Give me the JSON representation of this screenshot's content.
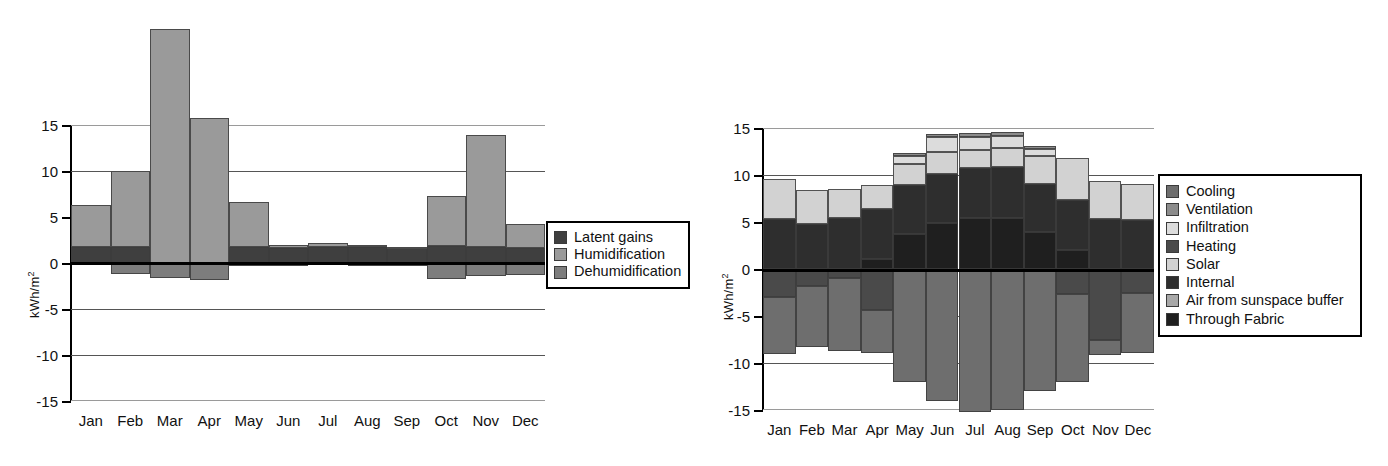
{
  "charts": [
    {
      "id": "latent-loads",
      "ylabel": "kWh/m",
      "ylabel_sup": "2",
      "yticks": [
        "15",
        "10",
        "5",
        "0",
        "-5",
        "-10",
        "-15"
      ],
      "ytick_values": [
        15,
        10,
        5,
        0,
        -5,
        -10,
        -15
      ],
      "categories": [
        "Jan",
        "Feb",
        "Mar",
        "Apr",
        "May",
        "Jun",
        "Jul",
        "Aug",
        "Sep",
        "Oct",
        "Nov",
        "Dec"
      ],
      "legend": [
        {
          "label": "Latent gains",
          "color": "#3f3f3f"
        },
        {
          "label": "Humidification",
          "color": "#9a9a9a"
        },
        {
          "label": "Dehumidification",
          "color": "#7d7d7d"
        }
      ]
    },
    {
      "id": "sensible-loads",
      "ylabel": "kWh/m",
      "ylabel_sup": "2",
      "yticks": [
        "15",
        "10",
        "5",
        "0",
        "-5",
        "-10",
        "-15"
      ],
      "ytick_values": [
        15,
        10,
        5,
        0,
        -5,
        -10,
        -15
      ],
      "categories": [
        "Jan",
        "Feb",
        "Mar",
        "Apr",
        "May",
        "Jun",
        "Jul",
        "Aug",
        "Sep",
        "Oct",
        "Nov",
        "Dec"
      ],
      "legend": [
        {
          "label": "Cooling",
          "color": "#6e6e6e"
        },
        {
          "label": "Ventilation",
          "color": "#8c8c8c"
        },
        {
          "label": "Infiltration",
          "color": "#dcdcdc"
        },
        {
          "label": "Heating",
          "color": "#4a4a4a"
        },
        {
          "label": "Solar",
          "color": "#d2d2d2"
        },
        {
          "label": "Internal",
          "color": "#2e2e2e"
        },
        {
          "label": "Air from sunspace buffer",
          "color": "#a8a8a8"
        },
        {
          "label": "Through Fabric",
          "color": "#1f1f1f"
        }
      ]
    }
  ],
  "chart_data": [
    {
      "type": "bar",
      "stacked": true,
      "title": "",
      "xlabel": "",
      "ylabel": "kWh/m2",
      "ylim": [
        -15,
        15
      ],
      "yticks": [
        -15,
        -10,
        -5,
        0,
        5,
        10,
        15
      ],
      "grid": true,
      "legend_position": "right",
      "categories": [
        "Jan",
        "Feb",
        "Mar",
        "Apr",
        "May",
        "Jun",
        "Jul",
        "Aug",
        "Sep",
        "Oct",
        "Nov",
        "Dec"
      ],
      "series": [
        {
          "name": "Latent gains",
          "color": "#3f3f3f",
          "values": [
            1.7,
            1.7,
            0.0,
            0.0,
            1.7,
            1.6,
            1.7,
            1.7,
            1.6,
            1.9,
            1.7,
            1.6
          ]
        },
        {
          "name": "Humidification",
          "color": "#9a9a9a",
          "values": [
            4.6,
            8.3,
            25.4,
            15.8,
            4.9,
            0.35,
            0.5,
            0.25,
            0.1,
            5.4,
            12.2,
            2.6
          ]
        },
        {
          "name": "Dehumidification",
          "color": "#7d7d7d",
          "values": [
            0.0,
            -1.2,
            -1.6,
            -1.8,
            -0.3,
            -0.3,
            -0.25,
            -0.3,
            -0.35,
            -1.7,
            -1.4,
            -1.3
          ]
        }
      ]
    },
    {
      "type": "bar",
      "stacked": true,
      "title": "",
      "xlabel": "",
      "ylabel": "kWh/m2",
      "ylim": [
        -15,
        15
      ],
      "yticks": [
        -15,
        -10,
        -5,
        0,
        5,
        10,
        15
      ],
      "grid": true,
      "legend_position": "right",
      "categories": [
        "Jan",
        "Feb",
        "Mar",
        "Apr",
        "May",
        "Jun",
        "Jul",
        "Aug",
        "Sep",
        "Oct",
        "Nov",
        "Dec"
      ],
      "series": [
        {
          "name": "Through Fabric",
          "color": "#1f1f1f",
          "values": [
            0.0,
            0.0,
            0.0,
            1.1,
            3.7,
            4.9,
            5.4,
            5.4,
            3.9,
            2.0,
            0.0,
            0.0
          ]
        },
        {
          "name": "Air from sunspace buffer",
          "color": "#a8a8a8",
          "values": [
            0.0,
            0.0,
            0.0,
            0.0,
            0.0,
            0.0,
            0.0,
            0.0,
            0.0,
            0.0,
            0.0,
            0.0
          ]
        },
        {
          "name": "Internal",
          "color": "#2e2e2e",
          "values": [
            5.3,
            4.8,
            5.4,
            5.3,
            5.2,
            5.2,
            5.3,
            5.4,
            5.1,
            5.3,
            5.3,
            5.2
          ]
        },
        {
          "name": "Solar",
          "color": "#d2d2d2",
          "values": [
            4.3,
            3.6,
            3.1,
            2.5,
            2.3,
            2.3,
            2.0,
            2.1,
            3.0,
            4.5,
            4.1,
            3.8
          ]
        },
        {
          "name": "Infiltration",
          "color": "#dcdcdc",
          "values": [
            0.0,
            0.0,
            0.0,
            0.0,
            0.8,
            1.6,
            1.3,
            1.2,
            0.8,
            0.0,
            0.0,
            0.0
          ]
        },
        {
          "name": "Ventilation",
          "color": "#8c8c8c",
          "values": [
            0.0,
            0.0,
            0.0,
            0.0,
            0.3,
            0.4,
            0.5,
            0.5,
            0.3,
            0.0,
            0.0,
            0.0
          ]
        },
        {
          "name": "Heating",
          "color": "#4a4a4a",
          "values": [
            -3.0,
            -1.8,
            -1.0,
            -4.4,
            0.0,
            0.0,
            0.0,
            0.0,
            0.0,
            -2.7,
            -7.6,
            -2.5
          ]
        },
        {
          "name": "Cooling",
          "color": "#6e6e6e",
          "values": [
            -6.0,
            -6.5,
            -7.7,
            -4.5,
            -12.0,
            -14.0,
            -15.2,
            -15.0,
            -13.0,
            -9.3,
            -1.6,
            -6.4
          ]
        }
      ],
      "annotations": {
        "note": "Positive segments stacked upward from zero; negative segments stacked downward from zero."
      }
    }
  ]
}
